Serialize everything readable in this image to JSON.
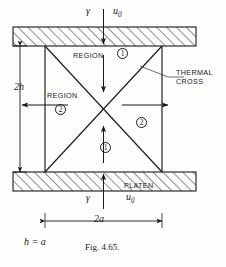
{
  "figure": {
    "caption": "Fig. 4.65.",
    "relation_note": "h = a",
    "title_alt": "Thermal cross in a platen-compressed square region"
  },
  "labels": {
    "top_gamma": "γ",
    "top_u0_base": "u",
    "top_u0_sub": "0",
    "bottom_gamma": "γ",
    "bottom_u0_base": "u",
    "bottom_u0_sub": "0",
    "region_top": "REGION",
    "region_left": "REGION",
    "platen": "PLATEN",
    "thermal_cross_line1": "THERMAL",
    "thermal_cross_line2": "CROSS",
    "dim_height": "2h",
    "dim_width": "2a"
  },
  "region_markers": [
    {
      "id": "region-1-top",
      "text": "1"
    },
    {
      "id": "region-2-left",
      "text": "2"
    },
    {
      "id": "region-2-right",
      "text": "2"
    },
    {
      "id": "region-1-bottom",
      "text": "1"
    }
  ],
  "colors": {
    "ink": "#1a1a1a",
    "paper": "#fdfdfb",
    "hatch": "#2b2b2b",
    "leader": "#3a3a3a"
  },
  "geometry": {
    "top_platen": {
      "x": 13,
      "y": 27,
      "w": 183,
      "h": 19
    },
    "bottom_platen": {
      "x": 13,
      "y": 172,
      "w": 183,
      "h": 19
    },
    "body": {
      "left": 45,
      "right": 162,
      "top": 46,
      "bottom": 172
    },
    "dim_width_value": "2a",
    "dim_height_value": "2h"
  }
}
